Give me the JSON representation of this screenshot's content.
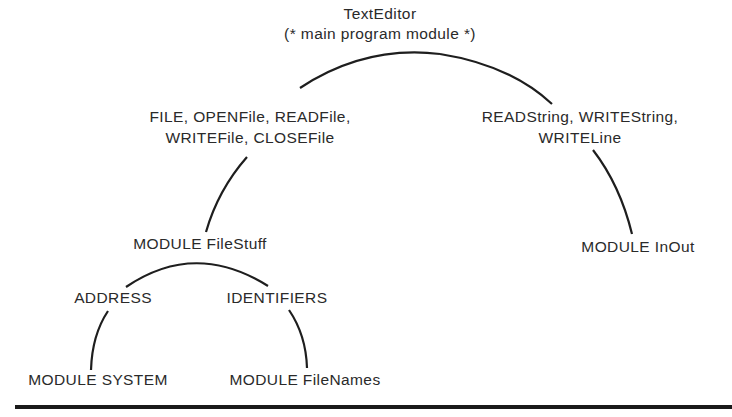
{
  "diagram": {
    "root": {
      "name": "TextEditor",
      "comment": "(* main program module *)"
    },
    "edges": {
      "root_to_filestuff": {
        "imports_line1": "FILE, OPENFile, READFile,",
        "imports_line2": "WRITEFile, CLOSEFile"
      },
      "root_to_inout": {
        "imports_line1": "READString, WRITEString,",
        "imports_line2": "WRITELine"
      },
      "filestuff_to_system": {
        "imports": "ADDRESS"
      },
      "filestuff_to_filenames": {
        "imports": "IDENTIFIERS"
      }
    },
    "nodes": {
      "filestuff": "MODULE FileStuff",
      "inout": "MODULE InOut",
      "system": "MODULE SYSTEM",
      "filenames": "MODULE FileNames"
    },
    "colors": {
      "ink": "#2a2a2a",
      "background": "#ffffff"
    }
  }
}
